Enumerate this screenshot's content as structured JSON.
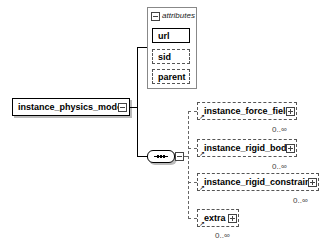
{
  "root": {
    "label": "instance_physics_model",
    "expanded": true
  },
  "attributes": {
    "title": "attributes",
    "items": [
      {
        "label": "url",
        "required": true
      },
      {
        "label": "sid",
        "required": false
      },
      {
        "label": "parent",
        "required": false
      }
    ]
  },
  "sequence": {
    "type": "sequence-compositor"
  },
  "children": [
    {
      "label": "instance_force_field",
      "cardinality": "0..∞"
    },
    {
      "label": "instance_rigid_body",
      "cardinality": "0..∞"
    },
    {
      "label": "instance_rigid_constraint",
      "cardinality": "0..∞"
    },
    {
      "label": "extra",
      "cardinality": "0..∞"
    }
  ]
}
